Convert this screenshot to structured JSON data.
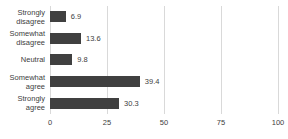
{
  "chart_data": {
    "type": "bar",
    "orientation": "horizontal",
    "title": "",
    "xlabel": "",
    "ylabel": "",
    "categories": [
      "Strongly disagree",
      "Somewhat disagree",
      "Neutral",
      "Somewhat agree",
      "Strongly agree"
    ],
    "values": [
      6.9,
      13.6,
      9.8,
      39.4,
      30.3
    ],
    "value_labels": [
      "6.9",
      "13.6",
      "9.8",
      "39.4",
      "30.3"
    ],
    "xlim": [
      0,
      100
    ],
    "x_ticks": [
      0,
      25,
      50,
      75,
      100
    ],
    "grid": true,
    "legend": "none",
    "bar_color": "#404040",
    "text_color": "#404040",
    "gridline_color": "#d9d9d9",
    "background_color": "#ffffff"
  }
}
